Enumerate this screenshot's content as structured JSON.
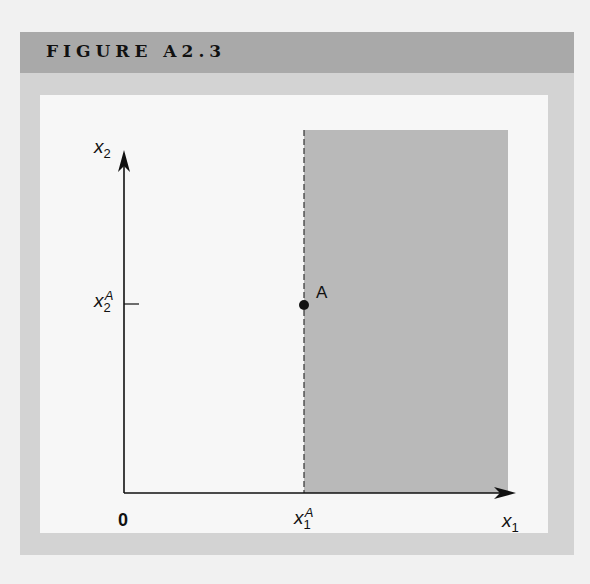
{
  "figure": {
    "title": "FIGURE A2.3"
  },
  "diagram": {
    "type": "region-diagram",
    "origin_label": "0",
    "x_axis": {
      "var": "x",
      "sub": "1"
    },
    "y_axis": {
      "var": "x",
      "sub": "2"
    },
    "x_tick": {
      "var": "x",
      "sub": "1",
      "sup": "A"
    },
    "y_tick": {
      "var": "x",
      "sub": "2",
      "sup": "A"
    },
    "point": {
      "label": "A"
    },
    "shaded_region": "x1 >= x1^A (all x2)",
    "colors": {
      "header_band": "#a9a9a9",
      "frame": "#d3d3d3",
      "shaded_region": "#b9b9b9",
      "axes": "#111111"
    }
  }
}
